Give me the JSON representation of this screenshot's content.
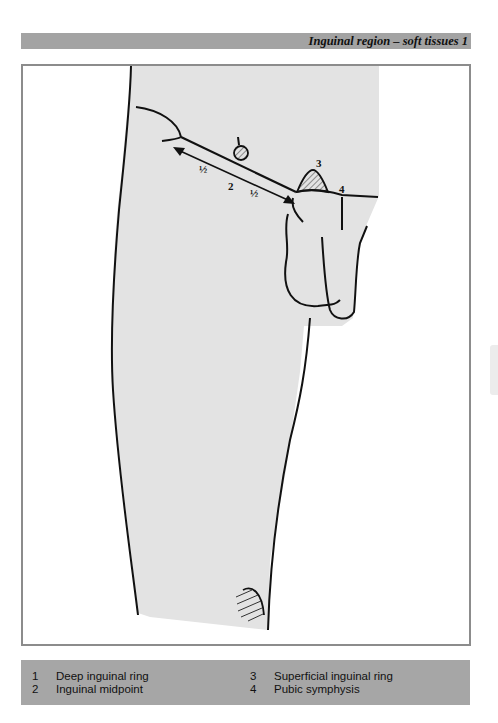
{
  "header": {
    "title": "Inguinal region – soft tissues 1"
  },
  "diagram": {
    "labels": {
      "deep_ring": "1",
      "midpoint": "2",
      "superficial_ring": "3",
      "pubic_symphysis": "4",
      "half_left": "½",
      "half_right": "½"
    },
    "colors": {
      "skin": "#e3e3e3",
      "outline": "#111111",
      "frame": "#8c8c8c",
      "header_bar": "#a3a3a3",
      "legend_bar": "#a6a6a6"
    }
  },
  "legend": {
    "left": [
      {
        "num": "1",
        "text": "Deep inguinal ring"
      },
      {
        "num": "2",
        "text": "Inguinal midpoint"
      }
    ],
    "right": [
      {
        "num": "3",
        "text": "Superficial inguinal ring"
      },
      {
        "num": "4",
        "text": "Pubic symphysis"
      }
    ]
  }
}
